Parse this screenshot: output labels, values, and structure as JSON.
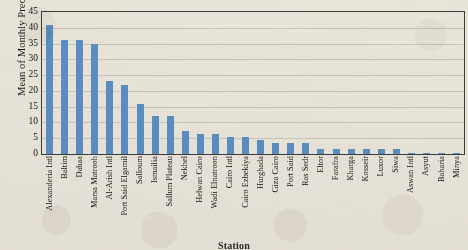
{
  "chart_data": {
    "type": "bar",
    "title": "",
    "xlabel": "Station",
    "ylabel": "Mean of  Monthly Precipitation (mm)",
    "ylim": [
      0,
      45
    ],
    "yticks": [
      0,
      5,
      10,
      15,
      20,
      25,
      30,
      35,
      40,
      45
    ],
    "grid": true,
    "legend": "none",
    "bar_color": "#5b8ec4",
    "categories": [
      "Alexanderia Intl",
      "Baltim",
      "Dabaa",
      "Marsa Matrooh",
      "Al-Arish Intl",
      "Port Said Elgamil",
      "Salloum",
      "Ismailia",
      "Sallum Plateau",
      "Nekhel",
      "Helwan Cairo",
      "Wadi Elnatroon",
      "Cairo Intl",
      "Cairo Ezbekiya",
      "Hurghada",
      "Giza Cairo",
      "Port Said",
      "Ras Sedr",
      "Eltor",
      "Farafra",
      "Kharga",
      "Kosseir",
      "Luxor",
      "Siwa",
      "Aswan Intl",
      "Asyut",
      "Baharia",
      "Minya"
    ],
    "values": [
      41,
      36,
      36,
      35,
      23,
      22,
      16,
      12,
      12,
      7.2,
      6.3,
      6.3,
      5.3,
      5.3,
      4.5,
      3.5,
      3.5,
      3.5,
      1.5,
      1.6,
      1.6,
      1.6,
      1.6,
      1.7,
      0.15,
      0.15,
      0.15,
      0.15
    ]
  }
}
